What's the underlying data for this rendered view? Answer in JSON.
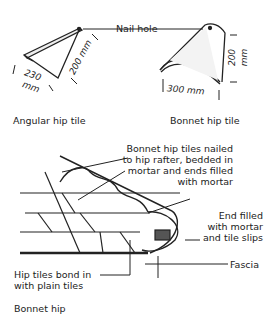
{
  "figure": {
    "top_labels": {
      "nail_hole": "Nail hole",
      "angular_caption": "Angular hip tile",
      "bonnet_caption": "Bonnet hip tile"
    },
    "dimensions": {
      "angular_width": "230",
      "angular_width_unit": "mm",
      "angular_height": "200 mm",
      "bonnet_width": "300 mm",
      "bonnet_height": "200",
      "bonnet_height_unit": "mm"
    },
    "bottom_labels": {
      "bonnet_nailed_1": "Bonnet hip tiles nailed",
      "bonnet_nailed_2": "to hip rafter, bedded in",
      "bonnet_nailed_3": "mortar and ends filled",
      "bonnet_nailed_4": "with mortar",
      "end_filled_1": "End filled",
      "end_filled_2": "with mortar",
      "end_filled_3": "and tile slips",
      "fascia": "Fascia",
      "hip_bond_1": "Hip tiles bond in",
      "hip_bond_2": "with plain tiles",
      "bonnet_hip_caption": "Bonnet hip"
    }
  }
}
